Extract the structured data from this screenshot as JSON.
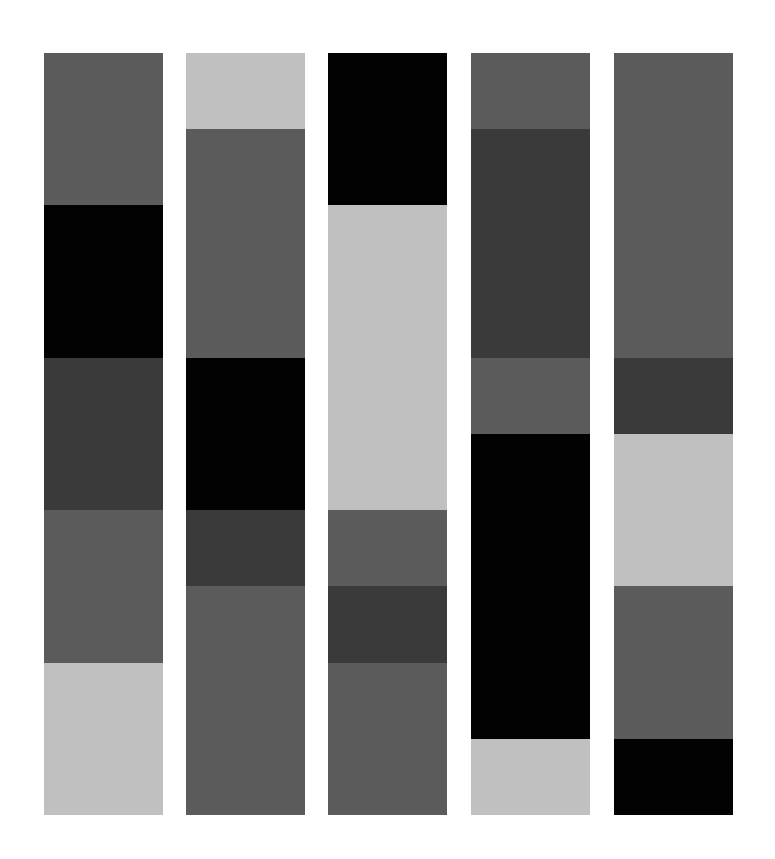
{
  "palette": {
    "light": "#c0c0c0",
    "medium": "#5b5b5b",
    "dark": "#3a3a3a",
    "black": "#020202"
  },
  "grid": {
    "top": 53,
    "unit_height": 76.2,
    "total_units": 10
  },
  "columns": [
    {
      "left": 44,
      "blocks": [
        {
          "tone": "medium",
          "units": 2
        },
        {
          "tone": "black",
          "units": 2
        },
        {
          "tone": "dark",
          "units": 2
        },
        {
          "tone": "medium",
          "units": 2
        },
        {
          "tone": "light",
          "units": 2
        }
      ]
    },
    {
      "left": 186,
      "blocks": [
        {
          "tone": "light",
          "units": 1
        },
        {
          "tone": "medium",
          "units": 3
        },
        {
          "tone": "black",
          "units": 2
        },
        {
          "tone": "dark",
          "units": 1
        },
        {
          "tone": "medium",
          "units": 3
        }
      ]
    },
    {
      "left": 328,
      "blocks": [
        {
          "tone": "black",
          "units": 2
        },
        {
          "tone": "light",
          "units": 4
        },
        {
          "tone": "medium",
          "units": 1
        },
        {
          "tone": "dark",
          "units": 1
        },
        {
          "tone": "medium",
          "units": 2
        }
      ]
    },
    {
      "left": 471,
      "blocks": [
        {
          "tone": "medium",
          "units": 1
        },
        {
          "tone": "dark",
          "units": 3
        },
        {
          "tone": "medium",
          "units": 1
        },
        {
          "tone": "black",
          "units": 4
        },
        {
          "tone": "light",
          "units": 1
        }
      ]
    },
    {
      "left": 614,
      "blocks": [
        {
          "tone": "medium",
          "units": 4
        },
        {
          "tone": "dark",
          "units": 1
        },
        {
          "tone": "light",
          "units": 2
        },
        {
          "tone": "medium",
          "units": 2
        },
        {
          "tone": "black",
          "units": 1
        }
      ]
    }
  ]
}
